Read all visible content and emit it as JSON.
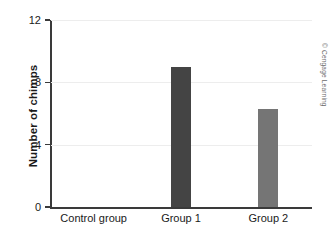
{
  "credit": "© Cengage Learning",
  "chart_data": {
    "type": "bar",
    "title": "",
    "xlabel": "",
    "ylabel": "Number of chimps",
    "categories": [
      "Control group",
      "Group 1",
      "Group 2"
    ],
    "values": [
      0,
      9,
      6.3
    ],
    "ylim": [
      0,
      12
    ],
    "yticks": [
      0,
      4,
      8,
      12
    ],
    "ytick_labels": [
      "0",
      "4",
      "8",
      "12"
    ],
    "grid": true,
    "grid_axis": "y",
    "legend": "none",
    "bar_colors": [
      "#444444",
      "#444444",
      "#757575"
    ],
    "axis_color": "#3a3a3a",
    "grid_color": "#ededed",
    "background": "#ffffff"
  }
}
